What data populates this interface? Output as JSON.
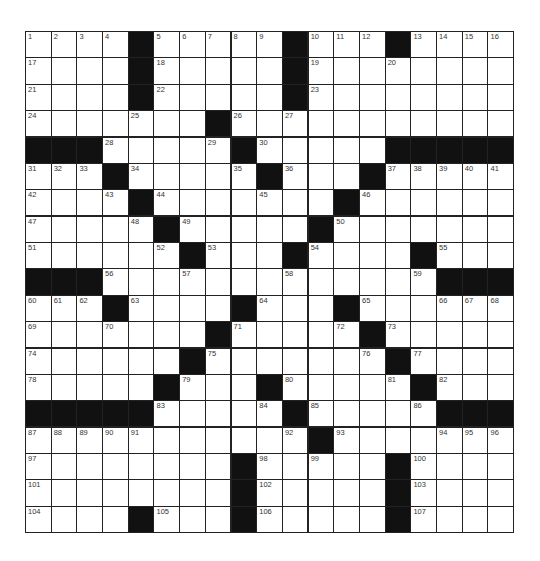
{
  "puzzle": {
    "rows": 19,
    "cols": 19,
    "colors": {
      "block": "#111111",
      "cell": "#ffffff",
      "line": "#222222",
      "number": "#333333"
    },
    "grid": [
      [
        "1",
        "2",
        "3",
        "4",
        "#",
        "5",
        "6",
        "7",
        "8",
        "9",
        "#",
        "10",
        "11",
        "12",
        "#",
        "13",
        "14",
        "15",
        "16"
      ],
      [
        "17",
        ".",
        ".",
        ".",
        "#",
        "18",
        ".",
        ".",
        ".",
        ".",
        "#",
        "19",
        ".",
        ".",
        "20",
        ".",
        ".",
        ".",
        "."
      ],
      [
        "21",
        ".",
        ".",
        ".",
        "#",
        "22",
        ".",
        ".",
        ".",
        ".",
        "#",
        "23",
        ".",
        ".",
        ".",
        ".",
        ".",
        ".",
        "."
      ],
      [
        "24",
        ".",
        ".",
        ".",
        "25",
        ".",
        ".",
        "#",
        "26",
        ".",
        "27",
        ".",
        ".",
        ".",
        ".",
        ".",
        ".",
        ".",
        "."
      ],
      [
        "#",
        "#",
        "#",
        "28",
        ".",
        ".",
        ".",
        "29",
        "#",
        "30",
        ".",
        ".",
        ".",
        ".",
        "#",
        "#",
        "#",
        "#",
        "#"
      ],
      [
        "31",
        "32",
        "33",
        "#",
        "34",
        ".",
        ".",
        ".",
        "35",
        "#",
        "36",
        ".",
        ".",
        "#",
        "37",
        "38",
        "39",
        "40",
        "41"
      ],
      [
        "42",
        ".",
        ".",
        "43",
        "#",
        "44",
        ".",
        ".",
        ".",
        "45",
        ".",
        ".",
        "#",
        "46",
        ".",
        ".",
        ".",
        ".",
        "."
      ],
      [
        "47",
        ".",
        ".",
        ".",
        "48",
        "#",
        "49",
        ".",
        ".",
        ".",
        ".",
        "#",
        "50",
        ".",
        ".",
        ".",
        ".",
        ".",
        "."
      ],
      [
        "51",
        ".",
        ".",
        ".",
        ".",
        "52",
        "#",
        "53",
        ".",
        ".",
        "#",
        "54",
        ".",
        ".",
        ".",
        "#",
        "55",
        ".",
        "."
      ],
      [
        "#",
        "#",
        "#",
        "56",
        ".",
        ".",
        "57",
        ".",
        ".",
        ".",
        "58",
        ".",
        ".",
        ".",
        ".",
        "59",
        "#",
        "#",
        "#"
      ],
      [
        "60",
        "61",
        "62",
        "#",
        "63",
        ".",
        ".",
        ".",
        "#",
        "64",
        ".",
        ".",
        "#",
        "65",
        ".",
        ".",
        "66",
        "67",
        "68"
      ],
      [
        "69",
        ".",
        ".",
        "70",
        ".",
        ".",
        ".",
        "#",
        "71",
        ".",
        ".",
        ".",
        "72",
        "#",
        "73",
        ".",
        ".",
        ".",
        "."
      ],
      [
        "74",
        ".",
        ".",
        ".",
        ".",
        ".",
        "#",
        "75",
        ".",
        ".",
        ".",
        ".",
        ".",
        "76",
        "#",
        "77",
        ".",
        ".",
        "."
      ],
      [
        "78",
        ".",
        ".",
        ".",
        ".",
        "#",
        "79",
        ".",
        ".",
        "#",
        "80",
        ".",
        ".",
        ".",
        "81",
        "#",
        "82",
        ".",
        "."
      ],
      [
        "#",
        "#",
        "#",
        "#",
        "#",
        "83",
        ".",
        ".",
        ".",
        "84",
        "#",
        "85",
        ".",
        ".",
        ".",
        "86",
        "#",
        "#",
        "#"
      ],
      [
        "87",
        "88",
        "89",
        "90",
        "91",
        ".",
        ".",
        ".",
        ".",
        ".",
        "92",
        "#",
        "93",
        ".",
        ".",
        ".",
        "94",
        "95",
        "96"
      ],
      [
        "97",
        ".",
        ".",
        ".",
        ".",
        ".",
        ".",
        ".",
        "#",
        "98",
        ".",
        "99",
        ".",
        ".",
        "#",
        "100",
        ".",
        ".",
        "."
      ],
      [
        "101",
        ".",
        ".",
        ".",
        ".",
        ".",
        ".",
        ".",
        "#",
        "102",
        ".",
        ".",
        ".",
        ".",
        "#",
        "103",
        ".",
        ".",
        "."
      ],
      [
        "104",
        ".",
        ".",
        ".",
        "#",
        "105",
        ".",
        ".",
        "#",
        "106",
        ".",
        ".",
        ".",
        ".",
        "#",
        "107",
        ".",
        ".",
        "."
      ]
    ]
  }
}
